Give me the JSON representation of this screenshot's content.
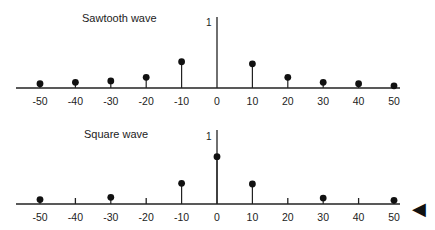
{
  "chart_data": [
    {
      "type": "stem",
      "title": "Sawtooth wave",
      "xlabel": "",
      "ylabel": "",
      "y_tick_label": "1",
      "x_ticks": [
        -50,
        -40,
        -30,
        -20,
        -10,
        0,
        10,
        20,
        30,
        40,
        50
      ],
      "x": [
        -50,
        -40,
        -30,
        -20,
        -10,
        10,
        20,
        30,
        40,
        50
      ],
      "values": [
        0.06,
        0.08,
        0.1,
        0.15,
        0.37,
        0.34,
        0.15,
        0.08,
        0.06,
        0.03
      ],
      "xlim": [
        -50,
        50
      ],
      "ylim": [
        0,
        1
      ],
      "grid": false
    },
    {
      "type": "stem",
      "title": "Square wave",
      "xlabel": "",
      "ylabel": "",
      "y_tick_label": "1",
      "x_ticks": [
        -50,
        -40,
        -30,
        -20,
        -10,
        0,
        10,
        20,
        30,
        40,
        50
      ],
      "x": [
        -50,
        -30,
        -10,
        0,
        10,
        30,
        50
      ],
      "values": [
        0.06,
        0.09,
        0.28,
        0.64,
        0.27,
        0.08,
        0.05
      ],
      "xlim": [
        -50,
        50
      ],
      "ylim": [
        0,
        1
      ],
      "grid": false
    }
  ],
  "decor": {
    "arrow_glyph": "◀",
    "color": "#111111"
  }
}
